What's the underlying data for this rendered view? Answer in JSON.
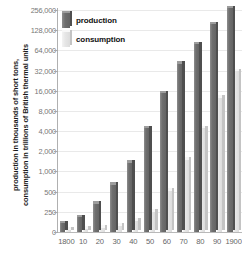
{
  "chart_data": {
    "type": "bar",
    "title": "",
    "xlabel": "",
    "ylabel_line1": "production in thousands of short tons,",
    "ylabel_line2": "consumption in trillions of British thermal units",
    "yscale": "log",
    "grid": true,
    "legend_position": "top-left",
    "categories": [
      "1800",
      "10",
      "20",
      "30",
      "40",
      "50",
      "60",
      "70",
      "80",
      "90",
      "1900"
    ],
    "ytick_labels": [
      "0",
      "250",
      "500",
      "1,000",
      "2,000",
      "4,000",
      "8,000",
      "16,000",
      "32,000",
      "64,000",
      "128,000",
      "256,000"
    ],
    "ytick_values": [
      0,
      250,
      500,
      1000,
      2000,
      4000,
      8000,
      16000,
      32000,
      64000,
      128000,
      256000
    ],
    "ylim": [
      0,
      256000
    ],
    "series": [
      {
        "name": "production",
        "color": "#6f6f6f",
        "values": [
          108,
          185,
          331,
          635,
          1345,
          4400,
          14600,
          40400,
          79500,
          157800,
          269700
        ]
      },
      {
        "name": "consumption",
        "color": "#e6e6e6",
        "values": [
          30,
          40,
          55,
          80,
          140,
          250,
          520,
          1500,
          4400,
          12500,
          31000
        ]
      }
    ]
  },
  "legend": {
    "items": [
      {
        "label": "production",
        "swatch": "production-swatch"
      },
      {
        "label": "consumption",
        "swatch": "consumption-swatch"
      }
    ]
  },
  "colors": {
    "production": "#6f6f6f",
    "consumption": "#e6e6e6",
    "grid": "#e9e9e9",
    "axis": "#b0b0b0",
    "tick_text": "#777777",
    "label_text": "#1a1a1a",
    "background": "#ffffff"
  }
}
